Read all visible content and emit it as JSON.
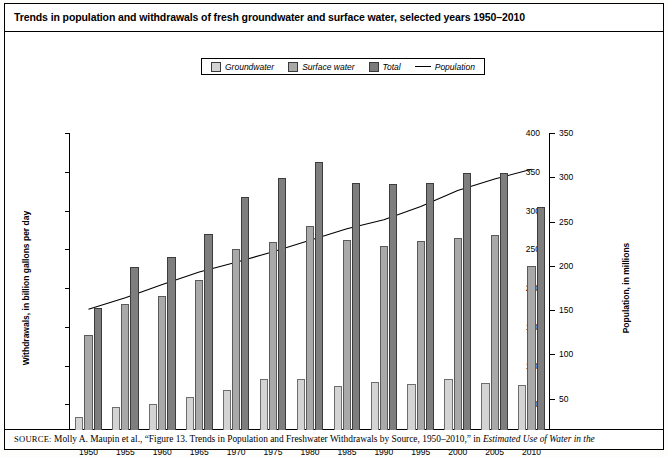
{
  "title": "Trends in population and withdrawals of fresh groundwater and surface water, selected years 1950–2010",
  "legend": {
    "items": [
      {
        "label": "Groundwater",
        "icon": "square-swatch-icon",
        "color": "#d4d4d4"
      },
      {
        "label": "Surface water",
        "icon": "square-swatch-icon",
        "color": "#a9a9a9"
      },
      {
        "label": "Total",
        "icon": "square-swatch-icon",
        "color": "#7e7e7e"
      },
      {
        "label": "Population",
        "icon": "line-swatch-icon",
        "color": "#000000"
      }
    ]
  },
  "source": {
    "lead": "SOURCE:",
    "body_1": " Molly A. Maupin et al., “Figure 13. Trends in Population and Freshwater Withdrawals by Source, 1950–2010,” in ",
    "body_italic": "Estimated Use of Water in the"
  },
  "chart_data": {
    "type": "bar",
    "title": "Trends in population and withdrawals of fresh groundwater and surface water, selected years 1950–2010",
    "xlabel": "",
    "ylabel": "Withdrawals, in billion gallons per day",
    "y2label": "Population, in millions",
    "ylim": [
      0,
      400
    ],
    "y2lim": [
      0,
      350
    ],
    "yticks": [
      0,
      50,
      100,
      150,
      200,
      250,
      300,
      350,
      400
    ],
    "y2ticks": [
      0,
      50,
      100,
      150,
      200,
      250,
      300,
      350
    ],
    "grid": false,
    "legend_position": "top-center",
    "categories": [
      "1950",
      "1955",
      "1960",
      "1965",
      "1970",
      "1975",
      "1980",
      "1985",
      "1990",
      "1995",
      "2000",
      "2005",
      "2010"
    ],
    "series": [
      {
        "name": "Groundwater",
        "axis": "left",
        "color": "#d4d4d4",
        "values": [
          34,
          47,
          50,
          60,
          68,
          82,
          83,
          73,
          79,
          76,
          83,
          78,
          75
        ]
      },
      {
        "name": "Surface water",
        "axis": "left",
        "color": "#a9a9a9",
        "values": [
          140,
          180,
          190,
          210,
          250,
          260,
          280,
          262,
          254,
          261,
          264,
          269,
          229
        ]
      },
      {
        "name": "Total",
        "axis": "left",
        "color": "#7e7e7e",
        "values": [
          174,
          227,
          240,
          270,
          318,
          342,
          363,
          335,
          334,
          335,
          348,
          348,
          304
        ]
      },
      {
        "name": "Population",
        "axis": "right",
        "type": "line",
        "color": "#000000",
        "values": [
          151,
          164,
          179,
          193,
          204,
          216,
          229,
          242,
          252,
          267,
          285,
          298,
          309
        ]
      }
    ]
  }
}
